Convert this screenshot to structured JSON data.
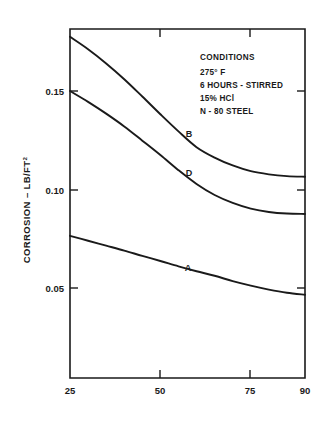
{
  "chart_data": {
    "type": "line",
    "title": "",
    "xlabel": "",
    "ylabel": "CORROSION – LB/FT²",
    "ylabel_main": "CORROSION – LB/FT",
    "ylabel_exponent": "2",
    "xlim": [
      25,
      90
    ],
    "ylim": [
      0.0,
      0.1775
    ],
    "grid": false,
    "legend_position": "inline-curve-labels",
    "x_ticks": [
      25,
      50,
      75,
      90
    ],
    "x_tick_labels": [
      "25",
      "50",
      "75",
      "90"
    ],
    "y_ticks": [
      0.05,
      0.1,
      0.15
    ],
    "y_tick_labels": [
      "0.05",
      "0.10",
      "0.15"
    ],
    "series": [
      {
        "name": "B",
        "label": "B",
        "x": [
          25,
          30,
          35,
          40,
          45,
          50,
          55,
          60,
          65,
          70,
          75,
          80,
          85,
          90
        ],
        "values": [
          0.1775,
          0.1712,
          0.164,
          0.156,
          0.1472,
          0.1382,
          0.1295,
          0.1215,
          0.1162,
          0.1122,
          0.1093,
          0.1077,
          0.1068,
          0.1065
        ]
      },
      {
        "name": "D",
        "label": "D",
        "x": [
          25,
          30,
          35,
          40,
          45,
          50,
          55,
          60,
          65,
          70,
          75,
          80,
          85,
          90
        ],
        "values": [
          0.15,
          0.1445,
          0.1385,
          0.132,
          0.1248,
          0.1175,
          0.1098,
          0.1028,
          0.0972,
          0.0932,
          0.0903,
          0.0886,
          0.0878,
          0.0876
        ]
      },
      {
        "name": "A",
        "label": "A",
        "x": [
          25,
          30,
          35,
          40,
          45,
          50,
          55,
          60,
          65,
          70,
          75,
          80,
          85,
          90
        ],
        "values": [
          0.0765,
          0.074,
          0.0715,
          0.069,
          0.0663,
          0.0637,
          0.061,
          0.0585,
          0.0562,
          0.0535,
          0.0512,
          0.0492,
          0.0476,
          0.0466
        ]
      }
    ],
    "annotations": {
      "conditions_title": "CONDITIONS",
      "conditions_lines": [
        "275° F",
        "6 HOURS - STIRRED",
        "15% HCl",
        "N - 80 STEEL"
      ]
    },
    "colors": {
      "axis": "#1a1a1a",
      "curve": "#1a1a1a",
      "background": "#ffffff"
    }
  }
}
